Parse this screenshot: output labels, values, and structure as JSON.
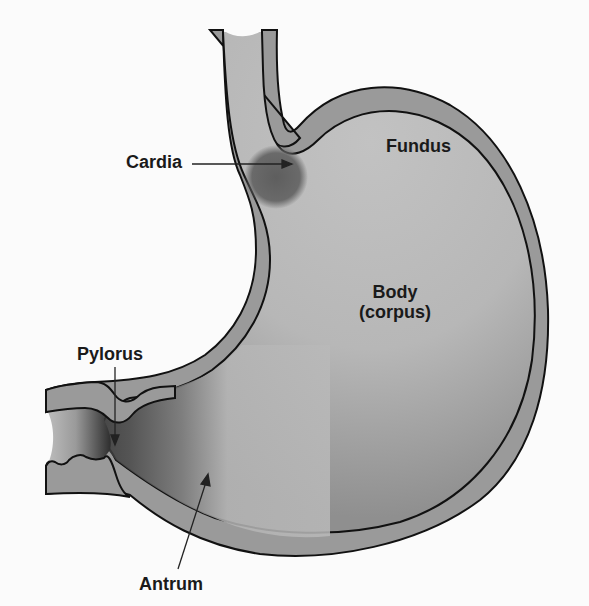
{
  "diagram": {
    "type": "anatomical-illustration",
    "colors": {
      "background": "#fbfbfb",
      "wall": "#9a9a9a",
      "lumen_light": "#bdbdbd",
      "lumen_dark": "#5a5a5a",
      "cardia_spot": "#6e6e6e",
      "outline": "#111111",
      "label_text": "#1a1a1a"
    },
    "labels": {
      "cardia": "Cardia",
      "fundus": "Fundus",
      "body_line1": "Body",
      "body_line2": "(corpus)",
      "pylorus": "Pylorus",
      "antrum": "Antrum"
    }
  }
}
